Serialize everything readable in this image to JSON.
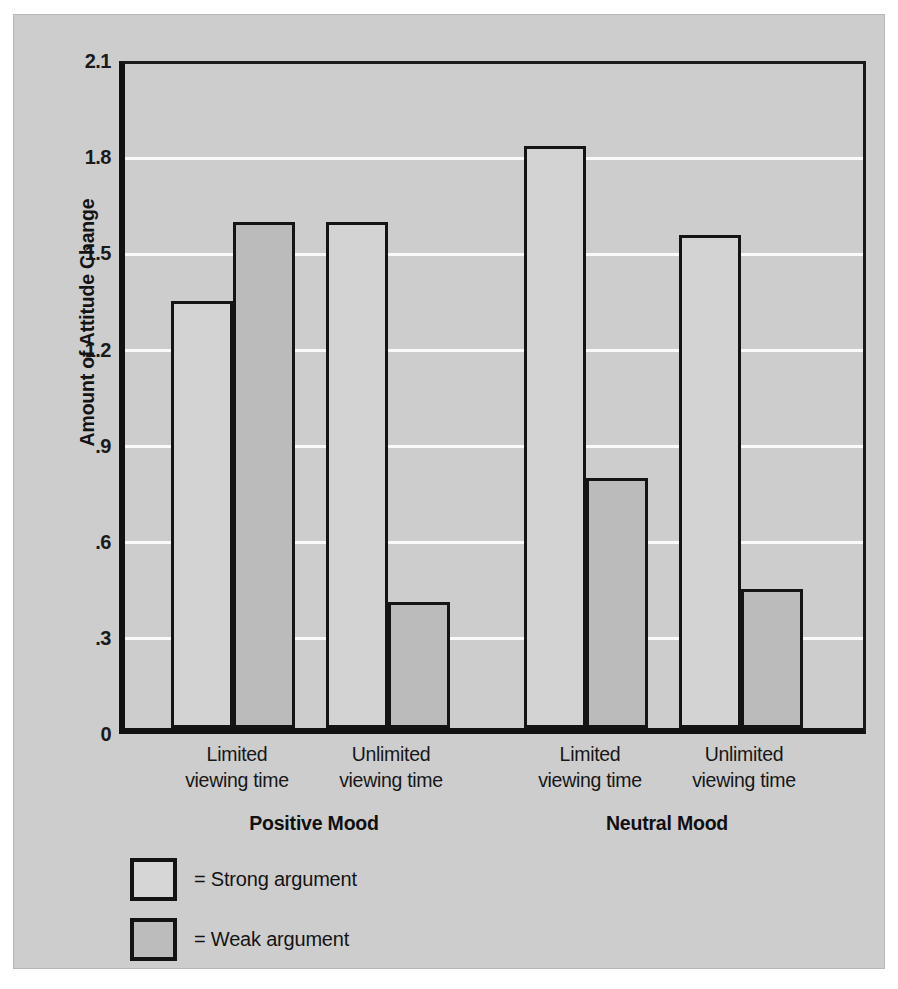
{
  "chart_data": {
    "type": "bar",
    "title": "",
    "xlabel": "",
    "ylabel": "Amount of Attitude Change",
    "ylim": [
      0,
      2.1
    ],
    "yticks": [
      "0",
      ".3",
      ".6",
      ".9",
      "1.2",
      "1.5",
      "1.8",
      "2.1"
    ],
    "ytick_values": [
      0,
      0.3,
      0.6,
      0.9,
      1.2,
      1.5,
      1.8,
      2.1
    ],
    "grid": true,
    "legend_position": "below-left",
    "groups": [
      "Positive Mood",
      "Neutral Mood"
    ],
    "categories": [
      "Limited\nviewing time",
      "Unlimited\nviewing time",
      "Limited\nviewing time",
      "Unlimited\nviewing time"
    ],
    "category_lines": [
      {
        "line1": "Limited",
        "line2": "viewing time"
      },
      {
        "line1": "Unlimited",
        "line2": "viewing time"
      },
      {
        "line1": "Limited",
        "line2": "viewing time"
      },
      {
        "line1": "Unlimited",
        "line2": "viewing time"
      }
    ],
    "series": [
      {
        "name": "Strong argument",
        "values": [
          1.35,
          1.6,
          1.84,
          1.56
        ],
        "color": "#d3d3d3"
      },
      {
        "name": "Weak argument",
        "values": [
          1.6,
          0.4,
          0.79,
          0.44
        ],
        "color": "#bbbbbb"
      }
    ],
    "bars": [
      {
        "label": "Positive / Limited / Strong",
        "value": 1.35,
        "series": "Strong argument"
      },
      {
        "label": "Positive / Limited / Weak",
        "value": 1.6,
        "series": "Weak argument"
      },
      {
        "label": "Positive / Unlimited / Strong",
        "value": 1.6,
        "series": "Strong argument"
      },
      {
        "label": "Positive / Unlimited / Weak",
        "value": 0.4,
        "series": "Weak argument"
      },
      {
        "label": "Neutral / Limited / Strong",
        "value": 1.84,
        "series": "Strong argument"
      },
      {
        "label": "Neutral / Limited / Weak",
        "value": 0.79,
        "series": "Weak argument"
      },
      {
        "label": "Neutral / Unlimited / Strong",
        "value": 1.56,
        "series": "Strong argument"
      },
      {
        "label": "Neutral / Unlimited / Weak",
        "value": 0.44,
        "series": "Weak argument"
      }
    ]
  },
  "axis": {
    "ylabel": "Amount of Attitude Change",
    "ticks": [
      "2.1",
      "1.8",
      "1.5",
      "1.2",
      ".9",
      ".6",
      ".3",
      "0"
    ]
  },
  "xaxis": {
    "labels": [
      {
        "line1": "Limited",
        "line2": "viewing time"
      },
      {
        "line1": "Unlimited",
        "line2": "viewing time"
      },
      {
        "line1": "Limited",
        "line2": "viewing time"
      },
      {
        "line1": "Unlimited",
        "line2": "viewing time"
      }
    ],
    "groups": [
      {
        "label": "Positive Mood"
      },
      {
        "label": "Neutral Mood"
      }
    ]
  },
  "legend": {
    "items": [
      {
        "text": "= Strong argument",
        "swatch": "strong"
      },
      {
        "text": "= Weak argument",
        "swatch": "weak"
      }
    ]
  },
  "colors": {
    "background": "#cdcdcd",
    "strong_bar": "#d3d3d3",
    "weak_bar": "#bbbbbb",
    "outline": "#141414",
    "gridline": "#fafafa"
  }
}
